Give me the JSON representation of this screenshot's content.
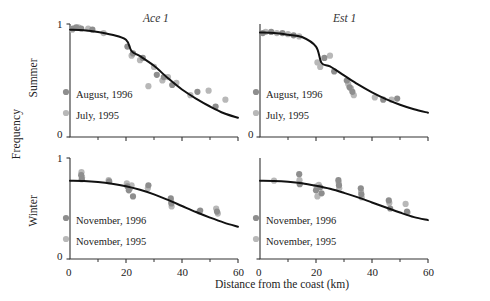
{
  "figure": {
    "ylabel": "Frequency",
    "xlabel": "Distance from the coast (km)",
    "row_labels": [
      "Summer",
      "Winter"
    ],
    "column_titles": [
      "Ace 1",
      "Est 1"
    ],
    "colors": {
      "curve": "#111111",
      "axis": "#333333",
      "marker_1996": "#8e8e8e",
      "marker_1995": "#b8b8b8",
      "text": "#222222"
    }
  },
  "axes": {
    "x": {
      "min": 0,
      "max": 60,
      "major_ticks": [
        0,
        20,
        40,
        60
      ],
      "major_tick_labels": [
        "0",
        "20",
        "40",
        "60"
      ],
      "minor_ticks": [
        10,
        30,
        50
      ]
    },
    "y": {
      "min": 0,
      "max": 1,
      "major_ticks": [
        0,
        1
      ],
      "major_tick_labels": [
        "0",
        "1"
      ]
    }
  },
  "chart_data": [
    {
      "type": "scatter",
      "panel": "top-left",
      "title": "Ace 1",
      "row": "Summer",
      "xlabel": "Distance from the coast (km)",
      "ylabel": "Frequency",
      "xlim": [
        0,
        60
      ],
      "ylim": [
        0,
        1
      ],
      "grid": false,
      "legend_position": "lower-left",
      "series": [
        {
          "name": "August, 1996",
          "color": "#8e8e8e",
          "points": [
            [
              1.0,
              0.96
            ],
            [
              2.2,
              0.97
            ],
            [
              4.0,
              0.96
            ],
            [
              8.0,
              0.95
            ],
            [
              20.5,
              0.8
            ],
            [
              22.5,
              0.74
            ],
            [
              26.0,
              0.7
            ],
            [
              31.0,
              0.55
            ],
            [
              33.5,
              0.53
            ],
            [
              36.5,
              0.46
            ],
            [
              45.5,
              0.4
            ],
            [
              52.0,
              0.27
            ]
          ]
        },
        {
          "name": "July, 1995",
          "color": "#b8b8b8",
          "points": [
            [
              0.8,
              0.95
            ],
            [
              3.0,
              0.97
            ],
            [
              6.5,
              0.96
            ],
            [
              12.0,
              0.92
            ],
            [
              22.0,
              0.72
            ],
            [
              25.0,
              0.68
            ],
            [
              30.0,
              0.62
            ],
            [
              33.0,
              0.5
            ],
            [
              35.0,
              0.53
            ],
            [
              38.0,
              0.48
            ],
            [
              43.0,
              0.37
            ],
            [
              49.5,
              0.41
            ],
            [
              55.5,
              0.33
            ],
            [
              28.0,
              0.45
            ]
          ]
        }
      ],
      "fit_curve": {
        "description": "monotone decreasing sigmoid fit",
        "points": [
          [
            0,
            0.95
          ],
          [
            5,
            0.945
          ],
          [
            10,
            0.93
          ],
          [
            15,
            0.905
          ],
          [
            20,
            0.86
          ],
          [
            22,
            0.76
          ],
          [
            25,
            0.715
          ],
          [
            30,
            0.63
          ],
          [
            35,
            0.52
          ],
          [
            40,
            0.42
          ],
          [
            45,
            0.34
          ],
          [
            50,
            0.27
          ],
          [
            55,
            0.21
          ],
          [
            60,
            0.17
          ]
        ]
      }
    },
    {
      "type": "scatter",
      "panel": "top-right",
      "title": "Est 1",
      "row": "Summer",
      "xlabel": "Distance from the coast (km)",
      "ylabel": "Frequency",
      "xlim": [
        0,
        60
      ],
      "ylim": [
        0,
        1
      ],
      "grid": false,
      "legend_position": "lower-left",
      "series": [
        {
          "name": "August, 1996",
          "color": "#8e8e8e",
          "points": [
            [
              1.0,
              0.92
            ],
            [
              4.0,
              0.93
            ],
            [
              8.0,
              0.92
            ],
            [
              12.0,
              0.9
            ],
            [
              23.0,
              0.7
            ],
            [
              26.5,
              0.58
            ],
            [
              31.0,
              0.5
            ],
            [
              32.0,
              0.44
            ],
            [
              33.0,
              0.4
            ],
            [
              44.0,
              0.33
            ],
            [
              49.0,
              0.34
            ]
          ]
        },
        {
          "name": "July, 1995",
          "color": "#b8b8b8",
          "points": [
            [
              2.0,
              0.93
            ],
            [
              6.0,
              0.92
            ],
            [
              10.0,
              0.91
            ],
            [
              14.0,
              0.89
            ],
            [
              21.5,
              0.62
            ],
            [
              25.0,
              0.72
            ],
            [
              31.5,
              0.47
            ],
            [
              32.5,
              0.43
            ],
            [
              33.5,
              0.37
            ],
            [
              41.0,
              0.35
            ],
            [
              47.0,
              0.33
            ],
            [
              20.5,
              0.66
            ]
          ]
        }
      ],
      "fit_curve": {
        "description": "monotone decreasing sigmoid fit",
        "points": [
          [
            0,
            0.925
          ],
          [
            5,
            0.92
          ],
          [
            10,
            0.905
          ],
          [
            15,
            0.885
          ],
          [
            20,
            0.8
          ],
          [
            22,
            0.655
          ],
          [
            25,
            0.625
          ],
          [
            30,
            0.545
          ],
          [
            35,
            0.465
          ],
          [
            40,
            0.395
          ],
          [
            45,
            0.335
          ],
          [
            50,
            0.285
          ],
          [
            55,
            0.245
          ],
          [
            60,
            0.215
          ]
        ]
      }
    },
    {
      "type": "scatter",
      "panel": "bottom-left",
      "title": "Ace 1",
      "row": "Winter",
      "xlabel": "Distance from the coast (km)",
      "ylabel": "Frequency",
      "xlim": [
        0,
        60
      ],
      "ylim": [
        0,
        1
      ],
      "grid": false,
      "legend_position": "lower-left",
      "series": [
        {
          "name": "November, 1996",
          "color": "#8e8e8e",
          "points": [
            [
              4.0,
              0.83
            ],
            [
              4.2,
              0.79
            ],
            [
              14.0,
              0.77
            ],
            [
              20.5,
              0.72
            ],
            [
              21.0,
              0.68
            ],
            [
              22.5,
              0.62
            ],
            [
              28.0,
              0.73
            ],
            [
              36.0,
              0.6
            ],
            [
              36.2,
              0.55
            ],
            [
              46.5,
              0.48
            ],
            [
              52.5,
              0.47
            ]
          ]
        },
        {
          "name": "November, 1995",
          "color": "#b8b8b8",
          "points": [
            [
              4.1,
              0.86
            ],
            [
              4.3,
              0.81
            ],
            [
              13.8,
              0.78
            ],
            [
              20.3,
              0.75
            ],
            [
              21.5,
              0.7
            ],
            [
              22.0,
              0.73
            ],
            [
              27.8,
              0.7
            ],
            [
              36.1,
              0.57
            ],
            [
              36.3,
              0.52
            ],
            [
              46.2,
              0.47
            ],
            [
              52.2,
              0.5
            ],
            [
              52.8,
              0.45
            ]
          ]
        }
      ],
      "fit_curve": {
        "description": "monotone decreasing curve fit",
        "points": [
          [
            0,
            0.775
          ],
          [
            5,
            0.772
          ],
          [
            10,
            0.762
          ],
          [
            15,
            0.745
          ],
          [
            20,
            0.72
          ],
          [
            25,
            0.685
          ],
          [
            30,
            0.64
          ],
          [
            35,
            0.585
          ],
          [
            40,
            0.525
          ],
          [
            45,
            0.465
          ],
          [
            50,
            0.41
          ],
          [
            55,
            0.36
          ],
          [
            60,
            0.32
          ]
        ]
      }
    },
    {
      "type": "scatter",
      "panel": "bottom-right",
      "title": "Est 1",
      "row": "Winter",
      "xlabel": "Distance from the coast (km)",
      "ylabel": "Frequency",
      "xlim": [
        0,
        60
      ],
      "ylim": [
        0,
        1
      ],
      "grid": false,
      "legend_position": "lower-left",
      "series": [
        {
          "name": "November, 1996",
          "color": "#8e8e8e",
          "points": [
            [
              14.0,
              0.84
            ],
            [
              14.2,
              0.74
            ],
            [
              20.0,
              0.68
            ],
            [
              21.5,
              0.71
            ],
            [
              22.0,
              0.65
            ],
            [
              28.0,
              0.78
            ],
            [
              28.2,
              0.73
            ],
            [
              36.0,
              0.7
            ],
            [
              36.2,
              0.64
            ],
            [
              46.0,
              0.58
            ],
            [
              46.5,
              0.5
            ],
            [
              52.5,
              0.47
            ]
          ]
        },
        {
          "name": "November, 1995",
          "color": "#b8b8b8",
          "points": [
            [
              5.0,
              0.775
            ],
            [
              14.1,
              0.78
            ],
            [
              20.2,
              0.72
            ],
            [
              21.0,
              0.735
            ],
            [
              28.1,
              0.755
            ],
            [
              28.3,
              0.7
            ],
            [
              36.1,
              0.665
            ],
            [
              36.3,
              0.61
            ],
            [
              46.2,
              0.555
            ],
            [
              52.0,
              0.545
            ],
            [
              52.7,
              0.46
            ],
            [
              20.5,
              0.62
            ]
          ]
        }
      ],
      "fit_curve": {
        "description": "monotone decreasing curve fit",
        "points": [
          [
            0,
            0.775
          ],
          [
            5,
            0.773
          ],
          [
            10,
            0.765
          ],
          [
            15,
            0.75
          ],
          [
            20,
            0.725
          ],
          [
            25,
            0.695
          ],
          [
            30,
            0.655
          ],
          [
            35,
            0.61
          ],
          [
            40,
            0.56
          ],
          [
            45,
            0.51
          ],
          [
            50,
            0.46
          ],
          [
            55,
            0.415
          ],
          [
            60,
            0.385
          ]
        ]
      }
    }
  ]
}
